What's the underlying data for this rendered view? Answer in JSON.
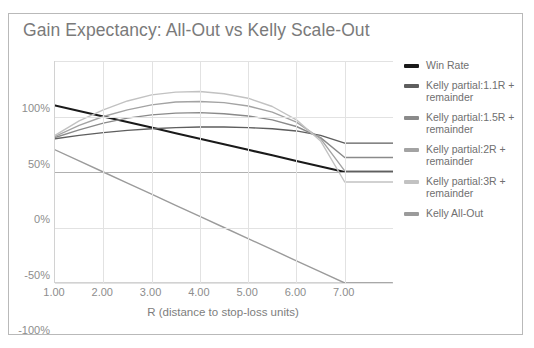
{
  "chart": {
    "title": "Gain Expectancy: All-Out vs Kelly Scale-Out",
    "xlabel": "R (distance to stop-loss units)",
    "ylabel": ""
  },
  "axes": {
    "y_ticks": [
      "100%",
      "50%",
      "0%",
      "-50%",
      "-100%"
    ],
    "x_ticks": [
      "1.00",
      "2.00",
      "3.00",
      "4.00",
      "5.00",
      "6.00",
      "7.00"
    ]
  },
  "legend": {
    "items": [
      {
        "label": "Win Rate",
        "color": "#1a1a1a"
      },
      {
        "label": "Kelly partial:1.1R + remainder",
        "color": "#5e5e5e"
      },
      {
        "label": "Kelly partial:1.5R + remainder",
        "color": "#8a8a8a"
      },
      {
        "label": "Kelly partial:2R + remainder",
        "color": "#a3a3a3"
      },
      {
        "label": "Kelly partial:3R + remainder",
        "color": "#c2c2c2"
      },
      {
        "label": "Kelly All-Out",
        "color": "#9b9b9b"
      }
    ]
  },
  "chart_data": {
    "type": "line",
    "title": "Gain Expectancy: All-Out vs Kelly Scale-Out",
    "xlabel": "R (distance to stop-loss units)",
    "ylabel": "",
    "xlim": [
      1.0,
      8.0
    ],
    "ylim": [
      -100,
      100
    ],
    "grid": true,
    "legend_position": "right",
    "x": [
      1.0,
      1.5,
      2.0,
      2.5,
      3.0,
      3.5,
      4.0,
      4.5,
      5.0,
      5.5,
      6.0,
      6.5,
      7.0,
      7.5,
      8.0
    ],
    "series": [
      {
        "name": "Win Rate",
        "color": "#1a1a1a",
        "values": [
          60,
          55,
          50,
          45,
          40,
          35,
          30,
          25,
          20,
          15,
          10,
          5,
          0,
          0,
          0
        ]
      },
      {
        "name": "Kelly partial:1.1R + remainder",
        "color": "#5e5e5e",
        "values": [
          30,
          33,
          35.5,
          37.5,
          39,
          40,
          40.5,
          40.5,
          40,
          39,
          37,
          33,
          26,
          26,
          26
        ]
      },
      {
        "name": "Kelly partial:1.5R + remainder",
        "color": "#8a8a8a",
        "values": [
          31,
          38,
          44,
          48.5,
          51.5,
          53,
          53.5,
          52.5,
          50.5,
          47,
          41,
          31,
          13,
          13,
          13
        ]
      },
      {
        "name": "Kelly partial:2R + remainder",
        "color": "#a3a3a3",
        "values": [
          32,
          42,
          50,
          56,
          60.5,
          63,
          63.5,
          62.5,
          59.5,
          54,
          45,
          30,
          1,
          1,
          1
        ]
      },
      {
        "name": "Kelly partial:3R + remainder",
        "color": "#c2c2c2",
        "values": [
          33,
          46,
          56,
          64,
          69.5,
          72,
          72.5,
          70.5,
          66.5,
          59,
          47,
          28,
          -9,
          -9,
          -9
        ]
      },
      {
        "name": "Kelly All-Out",
        "color": "#9b9b9b",
        "values": [
          20,
          10,
          0,
          -10,
          -20,
          -30,
          -40,
          -50,
          -60,
          -70,
          -80,
          -90,
          -100,
          -100,
          -100
        ]
      }
    ]
  }
}
